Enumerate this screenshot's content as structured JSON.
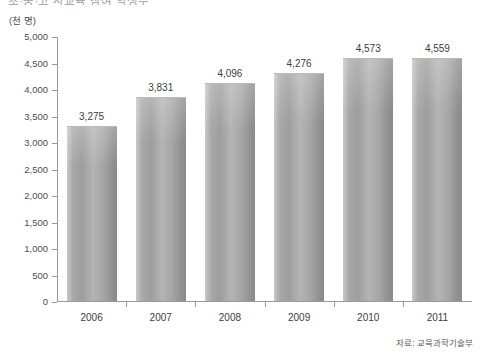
{
  "title": {
    "text": "초·중·고 사교육 참여 학생수",
    "clipped": true
  },
  "unit_label": "(천 명)",
  "source_note": "자료: 교육과학기술부",
  "colors": {
    "bar_light": "#c9c9c9",
    "bar_mid": "#a8a8a8",
    "bar_dark": "#8a8a8a",
    "axis": "#9a9a9a",
    "text": "#3d3d3d",
    "background": "#ffffff"
  },
  "chart_data": {
    "type": "bar",
    "title": "초·중·고 사교육 참여 학생수",
    "xlabel": "",
    "ylabel": "(천 명)",
    "ylim": [
      0,
      5000
    ],
    "ytick_step": 500,
    "ytick_labels": [
      "5,000",
      "4,500",
      "4,000",
      "3,500",
      "3,000",
      "2,500",
      "2,000",
      "1,500",
      "1,000",
      "500",
      "0"
    ],
    "ytick_values": [
      5000,
      4500,
      4000,
      3500,
      3000,
      2500,
      2000,
      1500,
      1000,
      500,
      0
    ],
    "grid": false,
    "legend": false,
    "categories": [
      "2006",
      "2007",
      "2008",
      "2009",
      "2010",
      "2011"
    ],
    "values": [
      3275,
      3831,
      4096,
      4276,
      4573,
      4559
    ],
    "value_labels": [
      "3,275",
      "3,831",
      "4,096",
      "4,276",
      "4,573",
      "4,559"
    ],
    "source": "자료: 교육과학기술부"
  }
}
